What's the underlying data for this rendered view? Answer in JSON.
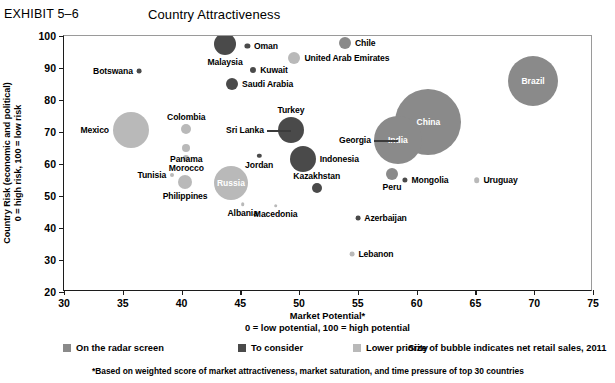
{
  "header": {
    "exhibit_label": "EXHIBIT 5–6",
    "title": "Country Attractiveness"
  },
  "axes": {
    "y_title_line1": "Country Risk (economic and political)",
    "y_title_line2": "0 = high risk, 100 = low risk",
    "x_title_line1": "Market Potential*",
    "x_title_line2": "0 = low potential, 100 = high potential"
  },
  "legend": {
    "items": [
      {
        "label": "On the radar screen",
        "color": "#8a8a8a"
      },
      {
        "label": "To consider",
        "color": "#4a4a4a"
      },
      {
        "label": "Lower priority",
        "color": "#b9b9b9"
      }
    ],
    "note": "Size of bubble indicates net retail sales, 2011"
  },
  "footnote": "*Based on weighted score of market attractiveness, market saturation, and time pressure of top 30 countries",
  "chart_data": {
    "type": "scatter",
    "title": "Country Attractiveness",
    "xlabel": "Market Potential*",
    "ylabel": "Country Risk (economic and political)",
    "xlim": [
      30,
      75
    ],
    "ylim": [
      20,
      100
    ],
    "xticks": [
      30,
      35,
      40,
      45,
      50,
      55,
      60,
      65,
      70,
      75
    ],
    "yticks": [
      20,
      30,
      40,
      50,
      60,
      70,
      80,
      90,
      100
    ],
    "grid": false,
    "legend_position": "below",
    "size_meaning": "net retail sales, 2011",
    "categories": {
      "on-the-radar-screen": "#8a8a8a",
      "to-consider": "#4a4a4a",
      "lower-priority": "#b9b9b9"
    },
    "points": [
      {
        "name": "Malaysia",
        "x": 43.7,
        "y": 97.5,
        "size": 11,
        "category": "to-consider",
        "label_pos": "below",
        "label_inside": false
      },
      {
        "name": "Oman",
        "x": 45.6,
        "y": 97.0,
        "size": 2.6,
        "category": "to-consider",
        "label_pos": "right",
        "label_inside": false
      },
      {
        "name": "Chile",
        "x": 53.9,
        "y": 97.8,
        "size": 6,
        "category": "on-the-radar-screen",
        "label_pos": "right",
        "label_inside": false
      },
      {
        "name": "United Arab Emirates",
        "x": 49.6,
        "y": 93.0,
        "size": 6,
        "category": "lower-priority",
        "label_pos": "right",
        "label_inside": false
      },
      {
        "name": "Kuwait",
        "x": 46.1,
        "y": 89.3,
        "size": 3,
        "category": "to-consider",
        "label_pos": "right",
        "label_inside": false
      },
      {
        "name": "Botswana",
        "x": 36.4,
        "y": 89.0,
        "size": 2.4,
        "category": "to-consider",
        "label_pos": "left",
        "label_inside": false
      },
      {
        "name": "Saudi Arabia",
        "x": 44.3,
        "y": 85.0,
        "size": 6,
        "category": "to-consider",
        "label_pos": "right",
        "label_inside": false
      },
      {
        "name": "Brazil",
        "x": 69.9,
        "y": 85.8,
        "size": 25,
        "category": "on-the-radar-screen",
        "label_pos": "inside",
        "label_inside": true
      },
      {
        "name": "Colombia",
        "x": 40.4,
        "y": 71.0,
        "size": 5,
        "category": "lower-priority",
        "label_pos": "above",
        "label_inside": false
      },
      {
        "name": "Mexico",
        "x": 35.7,
        "y": 70.5,
        "size": 18,
        "category": "lower-priority",
        "label_pos": "left",
        "label_inside": false
      },
      {
        "name": "Turkey",
        "x": 49.3,
        "y": 70.5,
        "size": 13,
        "category": "to-consider",
        "label_pos": "above",
        "label_inside": false
      },
      {
        "name": "Sri Lanka",
        "x": 49.3,
        "y": 70.5,
        "size": 0,
        "category": "to-consider",
        "label_pos": "leader-left",
        "label_inside": false
      },
      {
        "name": "China",
        "x": 61.0,
        "y": 73.2,
        "size": 33,
        "category": "on-the-radar-screen",
        "label_pos": "inside",
        "label_inside": true
      },
      {
        "name": "Georgia",
        "x": 58.4,
        "y": 67.4,
        "size": 0,
        "category": "on-the-radar-screen",
        "label_pos": "leader-left",
        "label_inside": false
      },
      {
        "name": "India",
        "x": 58.4,
        "y": 67.4,
        "size": 24,
        "category": "on-the-radar-screen",
        "label_pos": "inside",
        "label_inside": true
      },
      {
        "name": "Panama",
        "x": 40.4,
        "y": 65.0,
        "size": 4,
        "category": "lower-priority",
        "label_pos": "below",
        "label_inside": false
      },
      {
        "name": "Morocco",
        "x": 40.4,
        "y": 62.0,
        "size": 3,
        "category": "lower-priority",
        "label_pos": "below",
        "label_inside": false
      },
      {
        "name": "Jordan",
        "x": 46.6,
        "y": 62.5,
        "size": 2.2,
        "category": "to-consider",
        "label_pos": "below",
        "label_inside": false
      },
      {
        "name": "Indonesia",
        "x": 50.3,
        "y": 61.5,
        "size": 13,
        "category": "to-consider",
        "label_pos": "right",
        "label_inside": false
      },
      {
        "name": "Tunisia",
        "x": 39.2,
        "y": 56.5,
        "size": 2,
        "category": "lower-priority",
        "label_pos": "left",
        "label_inside": false
      },
      {
        "name": "Philippines",
        "x": 40.3,
        "y": 54.5,
        "size": 7,
        "category": "lower-priority",
        "label_pos": "below",
        "label_inside": false
      },
      {
        "name": "Russia",
        "x": 44.2,
        "y": 54.0,
        "size": 17,
        "category": "lower-priority",
        "label_pos": "inside",
        "label_inside": true
      },
      {
        "name": "Kazakhstan",
        "x": 51.5,
        "y": 52.5,
        "size": 5,
        "category": "to-consider",
        "label_pos": "above",
        "label_inside": false
      },
      {
        "name": "Mongolia",
        "x": 59.0,
        "y": 55.0,
        "size": 2.6,
        "category": "to-consider",
        "label_pos": "right",
        "label_inside": false
      },
      {
        "name": "Uruguay",
        "x": 65.1,
        "y": 55.0,
        "size": 2.8,
        "category": "lower-priority",
        "label_pos": "right",
        "label_inside": false
      },
      {
        "name": "Peru",
        "x": 57.9,
        "y": 56.8,
        "size": 6,
        "category": "on-the-radar-screen",
        "label_pos": "below",
        "label_inside": false
      },
      {
        "name": "Albania",
        "x": 45.2,
        "y": 47.5,
        "size": 1.8,
        "category": "lower-priority",
        "label_pos": "below",
        "label_inside": false
      },
      {
        "name": "Macedonia",
        "x": 48.0,
        "y": 47.0,
        "size": 1.8,
        "category": "lower-priority",
        "label_pos": "below",
        "label_inside": false
      },
      {
        "name": "Azerbaijan",
        "x": 55.0,
        "y": 43.0,
        "size": 2.4,
        "category": "to-consider",
        "label_pos": "right",
        "label_inside": false
      },
      {
        "name": "Lebanon",
        "x": 54.5,
        "y": 31.8,
        "size": 2.4,
        "category": "lower-priority",
        "label_pos": "right",
        "label_inside": false
      }
    ]
  }
}
